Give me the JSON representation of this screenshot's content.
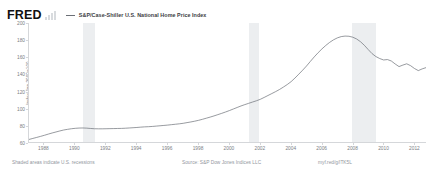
{
  "top_strip": {
    "clipped_text": ""
  },
  "header": {
    "logo_text": "FRED",
    "logo_mark_name": "fred-bar-chart-mark",
    "legend": [
      {
        "label": "S&P/Case-Shiller U.S. National Home Price Index",
        "color": "#6b6f76"
      }
    ]
  },
  "footer": {
    "recession_note": "Shaded areas indicate U.S. recessions",
    "source": "Source: S&P Dow Jones Indices LLC",
    "shortlink": "myf.red/g/lTK5L"
  },
  "chart_data": {
    "type": "line",
    "title": "S&P/Case-Shiller U.S. National Home Price Index",
    "xlabel": "",
    "ylabel": "Index Jan 2000=100",
    "ylim": [
      60,
      200
    ],
    "xlim": [
      1987.0,
      2012.75
    ],
    "grid": false,
    "legend_position": "top",
    "y_ticks": [
      60,
      80,
      100,
      120,
      140,
      160,
      180,
      200
    ],
    "x_ticks": [
      1988,
      1990,
      1992,
      1994,
      1996,
      1998,
      2000,
      2002,
      2004,
      2006,
      2008,
      2010,
      2012
    ],
    "x_tick_labels": [
      "1988",
      "1990",
      "1992",
      "1994",
      "1996",
      "1998",
      "2000",
      "2002",
      "2004",
      "2006",
      "2008",
      "2010",
      "2012"
    ],
    "series": [
      {
        "name": "S&P/Case-Shiller U.S. National Home Price Index",
        "color": "#6b6f76",
        "x": [
          1987.0,
          1987.25,
          1987.5,
          1987.75,
          1988.0,
          1988.25,
          1988.5,
          1988.75,
          1989.0,
          1989.25,
          1989.5,
          1989.75,
          1990.0,
          1990.25,
          1990.5,
          1990.75,
          1991.0,
          1991.25,
          1991.5,
          1991.75,
          1992.0,
          1992.25,
          1992.5,
          1992.75,
          1993.0,
          1993.25,
          1993.5,
          1993.75,
          1994.0,
          1994.25,
          1994.5,
          1994.75,
          1995.0,
          1995.25,
          1995.5,
          1995.75,
          1996.0,
          1996.25,
          1996.5,
          1996.75,
          1997.0,
          1997.25,
          1997.5,
          1997.75,
          1998.0,
          1998.25,
          1998.5,
          1998.75,
          1999.0,
          1999.25,
          1999.5,
          1999.75,
          2000.0,
          2000.25,
          2000.5,
          2000.75,
          2001.0,
          2001.25,
          2001.5,
          2001.75,
          2002.0,
          2002.25,
          2002.5,
          2002.75,
          2003.0,
          2003.25,
          2003.5,
          2003.75,
          2004.0,
          2004.25,
          2004.5,
          2004.75,
          2005.0,
          2005.25,
          2005.5,
          2005.75,
          2006.0,
          2006.25,
          2006.5,
          2006.75,
          2007.0,
          2007.25,
          2007.5,
          2007.75,
          2008.0,
          2008.25,
          2008.5,
          2008.75,
          2009.0,
          2009.25,
          2009.5,
          2009.75,
          2010.0,
          2010.25,
          2010.5,
          2010.75,
          2011.0,
          2011.25,
          2011.5,
          2011.75,
          2012.0,
          2012.25,
          2012.5,
          2012.75
        ],
        "y": [
          63.0,
          64.2,
          65.4,
          66.6,
          67.9,
          69.3,
          70.6,
          71.8,
          73.0,
          74.1,
          74.9,
          75.6,
          76.1,
          76.4,
          76.5,
          76.3,
          75.9,
          75.6,
          75.5,
          75.5,
          75.6,
          75.7,
          75.8,
          75.9,
          76.0,
          76.2,
          76.5,
          76.8,
          77.1,
          77.5,
          77.8,
          78.0,
          78.3,
          78.7,
          79.1,
          79.5,
          79.9,
          80.4,
          80.9,
          81.4,
          82.0,
          82.8,
          83.6,
          84.5,
          85.5,
          86.7,
          88.0,
          89.3,
          90.7,
          92.2,
          93.7,
          95.3,
          97.0,
          98.8,
          100.6,
          102.4,
          104.0,
          105.5,
          107.0,
          108.5,
          110.2,
          112.4,
          114.7,
          117.0,
          119.3,
          121.8,
          124.6,
          127.6,
          131.0,
          135.2,
          139.8,
          144.5,
          149.4,
          154.8,
          160.1,
          165.0,
          169.5,
          173.6,
          177.2,
          180.2,
          182.5,
          184.0,
          184.6,
          184.4,
          183.3,
          181.2,
          178.0,
          173.8,
          168.8,
          164.0,
          160.5,
          158.2,
          156.5,
          157.0,
          155.3,
          151.8,
          148.7,
          150.5,
          152.0,
          149.8,
          146.5,
          144.0,
          146.0,
          147.5
        ]
      }
    ],
    "recession_bands": [
      {
        "start": 1990.5,
        "end": 1991.25
      },
      {
        "start": 2001.25,
        "end": 2001.9
      },
      {
        "start": 2007.95,
        "end": 2009.5
      }
    ]
  }
}
